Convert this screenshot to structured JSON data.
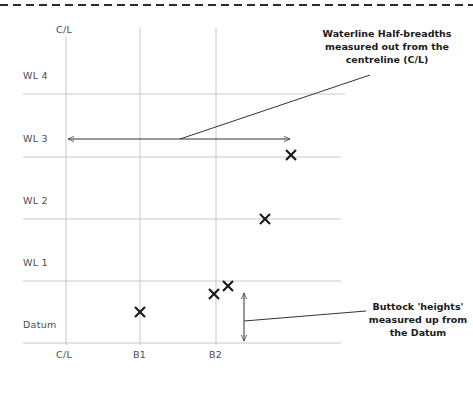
{
  "figure": {
    "type": "naval-architecture-lines-plan-grid",
    "top_rule": "dashed",
    "background_color": "#ffffff",
    "grid_color": "#c8c8c8",
    "ink_color": "#333333",
    "marker_color": "#1a1a1a"
  },
  "horizontal_lines": [
    {
      "label": "WL 4",
      "y": 94,
      "label_x": 23,
      "label_y": 76,
      "x_start": 23,
      "x_end": 345
    },
    {
      "label": "WL 3",
      "y": 157,
      "label_x": 23,
      "label_y": 139,
      "x_start": 23,
      "x_end": 341
    },
    {
      "label": "WL 2",
      "y": 219,
      "label_x": 23,
      "label_y": 201,
      "x_start": 23,
      "x_end": 341
    },
    {
      "label": "WL 1",
      "y": 281,
      "label_x": 23,
      "label_y": 263,
      "x_start": 23,
      "x_end": 341
    },
    {
      "label": "Datum",
      "y": 343,
      "label_x": 23,
      "label_y": 325,
      "x_start": 23,
      "x_end": 341
    }
  ],
  "vertical_lines": [
    {
      "label": "C/L",
      "x": 66,
      "top_label": "C/L",
      "top_label_y": 28,
      "bottom_label_y": 352,
      "y_start": 36,
      "y_end": 345
    },
    {
      "label": "B1",
      "x": 140,
      "top_label": "",
      "top_label_y": 0,
      "bottom_label_y": 352,
      "y_start": 28,
      "y_end": 345
    },
    {
      "label": "B2",
      "x": 216,
      "top_label": "",
      "top_label_y": 0,
      "bottom_label_y": 352,
      "y_start": 28,
      "y_end": 345
    }
  ],
  "markers": [
    {
      "name": "offset-point-wl3",
      "x": 291,
      "y": 155
    },
    {
      "name": "offset-point-wl2",
      "x": 265,
      "y": 219
    },
    {
      "name": "offset-point-wl1-outer",
      "x": 228,
      "y": 286
    },
    {
      "name": "offset-point-wl1-inner",
      "x": 214,
      "y": 294
    },
    {
      "name": "offset-point-b1",
      "x": 140,
      "y": 312
    }
  ],
  "dimension_arrows": [
    {
      "name": "half-breadth-dimension",
      "orientation": "horizontal",
      "x1": 66,
      "y1": 139,
      "x2": 292,
      "y2": 139
    },
    {
      "name": "buttock-height-dimension",
      "orientation": "vertical",
      "x1": 244,
      "y1": 291,
      "x2": 244,
      "y2": 343
    }
  ],
  "leaders": [
    {
      "name": "half-breadth-leader",
      "x1": 180,
      "y1": 139,
      "x2": 370,
      "y2": 75
    },
    {
      "name": "buttock-height-leader",
      "x1": 244,
      "y1": 321,
      "x2": 366,
      "y2": 311
    }
  ],
  "annotations": [
    {
      "name": "half-breadth-note",
      "lines": [
        "Waterline Half-breadths",
        "measured out from the",
        "centreline (C/L)"
      ],
      "x": 312,
      "y": 29,
      "width": 150
    },
    {
      "name": "buttock-height-note",
      "lines": [
        "Buttock 'heights'",
        "measured up from",
        "the Datum"
      ],
      "x": 371,
      "y": 302,
      "width": 97
    }
  ],
  "bottom_labels": [
    {
      "label": "C/L",
      "x": 66
    },
    {
      "label": "B1",
      "x": 140
    },
    {
      "label": "B2",
      "x": 216
    }
  ]
}
